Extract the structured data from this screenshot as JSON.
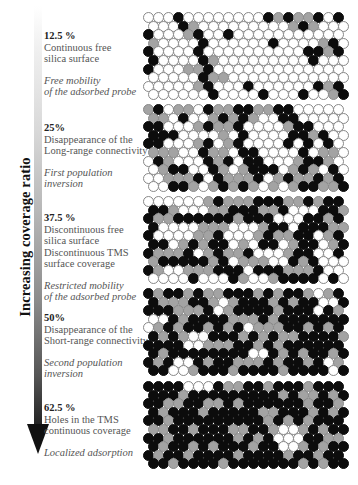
{
  "axis": {
    "title": "Increasing coverage ratio",
    "direction": "down"
  },
  "colors": {
    "free_silica": "#ffffff",
    "probe": "#a3a3a3",
    "tms": "#0c0c0c"
  },
  "panels": [
    {
      "percent": "12.5 %",
      "description": "Continuous free\nsilica surface",
      "note": "Free mobility\nof the adsorbed probe",
      "label_top": 30,
      "grid_top": 12,
      "rows": [
        "WWWBWWWWWWWWBGBGGBWB",
        "WWWBGWWWWWWWWWGBGWWW",
        "BWWWGBWWBWWWWWWWWWWW",
        "GWWWWBWWWWWWBWWWWGBW",
        "BWWWWBWWWWWWWWWWBBGB",
        "BWWWWBGWWWWWWWWWBWWW",
        "BWWWGGBWWWWWWWWWWWWW",
        "WWWWWBGGWWWWWWWWWWWW",
        "WWWWWGBWWWBWWWWWWBGB",
        "WWWWWWBWWWWBWWWBWWGB"
      ]
    },
    {
      "percent": "25%",
      "description": "Disappearance of the\nLong-range connectivity",
      "note": "First population inversion",
      "label_top": 122,
      "grid_top": 104,
      "rows": [
        "GBWGGWBGGBBGGBBWWWWW",
        "GGWBWWGBGBGWWBBWWWWW",
        "BBWWWGBGGBWWWWGBBWWW",
        "BBBWWWWGWBWWWWBBGBWW",
        "BBWWWGBWGBWWWWBWBWBW",
        "GGGWWBGGWBBWWWWBWGGW",
        "WBGWWWBGBWBBWWWGBBGW",
        "WGBBWWBGWGBBBWGBGWBW",
        "WWGGGBWBGGGBWGBGGBGB",
        "WWBBGWGBGBGWGWGBBGGB"
      ]
    },
    {
      "percent": "37.5 %",
      "description": "Discontinuous free\nsilica surface\nDiscontinuous TMS\nsurface coverage",
      "note": "Restricted mobility\nof the adsorbed probe",
      "label_top": 212,
      "grid_top": 196,
      "rows": [
        "WWWWWWGBGGGBBBGGBGBB",
        "BBGWWWGGBBBGGBWWWBBG",
        "BGGBBBBBBGBBBWWWBBGB",
        "BWWWWGGGWWWGBBWBBBGG",
        "BWWWWGGBWWWGBGGBBWGB",
        "BBWGBGBBWGWBBWGBBWGB",
        "BGGGBWGBGGBWWWGBBWWB",
        "GBBBBBGBWGGGWWBGBWWW",
        "BGWWGGGBBBWBBBGGGBWW",
        "WWWWBWWWBGWWGBBBBWBW"
      ]
    },
    {
      "percent": "50%",
      "description": "Disappearance of the\nShort-range connectivity",
      "note": "Second population inversion",
      "label_top": 312,
      "grid_top": 288,
      "rows": [
        "BGBBGBGGBBBGBGBBGWGB",
        "BGGGBBGWGBBBGBGBBWWBW",
        "BBBGGGBWGBBBBGBBBWBG",
        "WWBGBBBBGGGBGBBBBBBB",
        "WGBGBBGBGBWGGGBBGBGB",
        "BGBGWWBBBGBGBGGBBBBG",
        "BBBBWWGGGBBGBGBBBBBB",
        "BGBBBBBBBBWWBGBGBBGB",
        "BGBWWBGBBGGGBGBBGBWG",
        "BBWWGBBBGBBBBGBBBBWB"
      ]
    },
    {
      "percent": "62.5 %",
      "description": "Holes in the TMS\ncontinuous coverage",
      "note": "Localized adsorption",
      "label_top": 402,
      "grid_top": 381,
      "rows": [
        "BBBBWWWBGGBBGBBBGBBB",
        "BBBGBBBBBBBBBGBGGBGB",
        "BBGGBBGGBGBBBBBBGBBG",
        "BGBBBGBBBBBGGBBBGBGB",
        "BBGBBBBBBBBBGBGBGBBB",
        "GGBBGBBBGGBBGWWGBGBB",
        "BBGBBBBBBGBGBWWWBBGG",
        "BGBBGBGBBBGBBWWGBGBB",
        "BGBBGBBBBGBBBBGBBGBB",
        "BBGBBBBGBBBBBBBGBGBB"
      ]
    }
  ]
}
